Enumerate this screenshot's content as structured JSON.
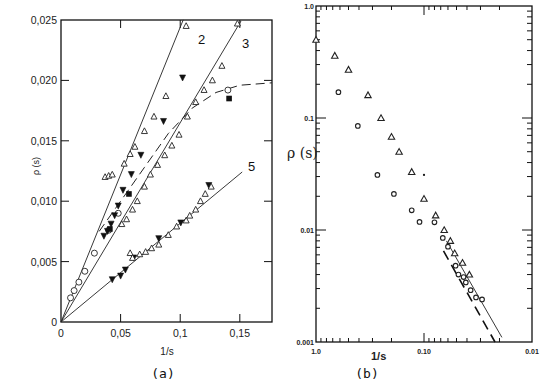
{
  "chart_data": [
    {
      "id": "a",
      "type": "scatter",
      "caption": "(a)",
      "title": "",
      "xlabel": "1/s",
      "ylabel": "ρ (s)",
      "xlim": [
        0,
        0.177
      ],
      "ylim": [
        0,
        0.025
      ],
      "x_ticks": [
        0,
        0.05,
        0.1,
        0.15
      ],
      "x_tick_labels": [
        "0",
        "0,05",
        "0,1",
        "0,15"
      ],
      "y_ticks": [
        0,
        0.005,
        0.01,
        0.015,
        0.02,
        0.025
      ],
      "y_tick_labels": [
        "0",
        "0,005",
        "0,010",
        "0,015",
        "0,020",
        "0,025"
      ],
      "grid": false,
      "fit_lines": [
        {
          "name": "2",
          "label": "2",
          "style": "solid",
          "slope": 0.244,
          "x_range": [
            0,
            0.1025
          ]
        },
        {
          "name": "3",
          "label": "3",
          "style": "solid",
          "slope": 0.165,
          "x_range": [
            0,
            0.151
          ]
        },
        {
          "name": "5",
          "label": "5",
          "style": "solid",
          "slope": 0.0817,
          "x_range": [
            0,
            0.152
          ]
        },
        {
          "name": "saturation",
          "label": "",
          "style": "dashed",
          "x": [
            0.032,
            0.05,
            0.07,
            0.09,
            0.11,
            0.13,
            0.15,
            0.177
          ],
          "y": [
            0.0075,
            0.01,
            0.0128,
            0.0156,
            0.0177,
            0.019,
            0.0196,
            0.0198
          ]
        }
      ],
      "series": [
        {
          "name": "open circles",
          "marker": "circle-open",
          "x": [
            0.008,
            0.011,
            0.015,
            0.02,
            0.028,
            0.04,
            0.048,
            0.14
          ],
          "y": [
            0.002,
            0.0026,
            0.0033,
            0.0042,
            0.0057,
            0.0076,
            0.009,
            0.0192
          ]
        },
        {
          "name": "filled down-triangles",
          "marker": "triangle-down-filled",
          "x": [
            0.036,
            0.039,
            0.042,
            0.045,
            0.048,
            0.052,
            0.059,
            0.067,
            0.086,
            0.102,
            0.043,
            0.05,
            0.054,
            0.061,
            0.082,
            0.1005,
            0.124
          ],
          "y": [
            0.0071,
            0.0075,
            0.0081,
            0.0088,
            0.0096,
            0.0109,
            0.0122,
            0.0138,
            0.0166,
            0.0202,
            0.0035,
            0.0038,
            0.0043,
            0.0053,
            0.0069,
            0.0082,
            0.0113
          ]
        },
        {
          "name": "filled squares",
          "marker": "square-filled",
          "x": [
            0.041,
            0.057,
            0.141
          ],
          "y": [
            0.0077,
            0.0106,
            0.0185
          ]
        },
        {
          "name": "open triangles (curve 2)",
          "marker": "triangle-up-open",
          "x": [
            0.037,
            0.04,
            0.043,
            0.053,
            0.058,
            0.062,
            0.07,
            0.078,
            0.088,
            0.105
          ],
          "y": [
            0.012,
            0.0121,
            0.0122,
            0.0131,
            0.0139,
            0.0145,
            0.0158,
            0.017,
            0.0187,
            0.0245
          ],
          "note": "open diamonds/triangles along curve 2"
        },
        {
          "name": "open triangles (curve 3)",
          "marker": "triangle-up-open",
          "x": [
            0.051,
            0.055,
            0.06,
            0.064,
            0.07,
            0.075,
            0.081,
            0.087,
            0.093,
            0.099,
            0.106,
            0.113,
            0.12,
            0.127,
            0.135,
            0.148
          ],
          "y": [
            0.0081,
            0.0085,
            0.0093,
            0.01,
            0.0112,
            0.0122,
            0.013,
            0.0138,
            0.0146,
            0.0155,
            0.017,
            0.0182,
            0.0192,
            0.02,
            0.0212,
            0.0247
          ]
        },
        {
          "name": "open triangles (curve 5)",
          "marker": "triangle-up-open",
          "x": [
            0.058,
            0.06,
            0.066,
            0.071,
            0.076,
            0.082,
            0.09,
            0.097,
            0.105,
            0.108,
            0.113,
            0.117,
            0.121,
            0.126
          ],
          "y": [
            0.0057,
            0.0053,
            0.0056,
            0.0058,
            0.0061,
            0.0064,
            0.0072,
            0.0079,
            0.0084,
            0.0088,
            0.0093,
            0.01,
            0.0106,
            0.0112
          ]
        }
      ],
      "annotations": [
        "2",
        "3",
        "5"
      ]
    },
    {
      "id": "b",
      "type": "scatter",
      "caption": "(b)",
      "title": "",
      "xlabel": "1/s",
      "ylabel": "ρ (s)",
      "xscale": "log",
      "yscale": "log",
      "xlim": [
        1.0,
        0.01
      ],
      "ylim": [
        0.001,
        1.0
      ],
      "x_ticks": [
        1.0,
        0.1,
        0.01
      ],
      "x_tick_labels": [
        "1.0",
        "0.10",
        "0.01"
      ],
      "y_ticks": [
        0.001,
        0.01,
        0.1,
        1.0
      ],
      "y_tick_labels": [
        "0.001",
        "0.01",
        "0.1",
        "1.0"
      ],
      "grid": false,
      "series": [
        {
          "name": "triangles",
          "marker": "triangle-up-open",
          "x": [
            1.0,
            0.67,
            0.5,
            0.33,
            0.25,
            0.2,
            0.17,
            0.13,
            0.1,
            0.078,
            0.065,
            0.057,
            0.052,
            0.044,
            0.038
          ],
          "y": [
            0.5,
            0.36,
            0.27,
            0.16,
            0.1,
            0.068,
            0.05,
            0.033,
            0.019,
            0.0135,
            0.01,
            0.008,
            0.0062,
            0.0051,
            0.004
          ]
        },
        {
          "name": "circles",
          "marker": "circle-open",
          "x": [
            0.62,
            0.41,
            0.27,
            0.19,
            0.13,
            0.11,
            0.08,
            0.067,
            0.06,
            0.051,
            0.048,
            0.043,
            0.041,
            0.037,
            0.033,
            0.029
          ],
          "y": [
            0.17,
            0.085,
            0.031,
            0.021,
            0.015,
            0.0118,
            0.0117,
            0.0085,
            0.0071,
            0.0048,
            0.004,
            0.0038,
            0.0034,
            0.0029,
            0.0025,
            0.0024
          ]
        },
        {
          "name": "dot",
          "marker": "dot",
          "x": [
            0.1
          ],
          "y": [
            0.031
          ]
        }
      ],
      "fit_lines": [
        {
          "name": "solid fit",
          "style": "solid",
          "x": [
            0.062,
            0.019
          ],
          "y": [
            0.008,
            0.0011
          ]
        },
        {
          "name": "dashed fit",
          "style": "dashed",
          "x": [
            0.066,
            0.022
          ],
          "y": [
            0.0065,
            0.001
          ]
        }
      ]
    }
  ]
}
